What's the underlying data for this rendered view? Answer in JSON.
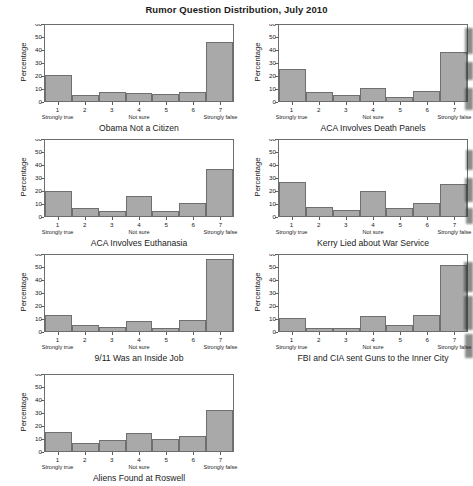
{
  "figure": {
    "title": "Rumor Question Distribution, July 2010",
    "ylabel": "Percentage",
    "yticks": [
      "0",
      "10",
      "20",
      "30",
      "40",
      "50",
      "60"
    ],
    "xticks": [
      "1",
      "2",
      "3",
      "4",
      "5",
      "6",
      "7"
    ],
    "xsub_1": "Strongly true",
    "xsub_4": "Not sure",
    "xsub_7": "Strongly false"
  },
  "chart_data": [
    {
      "type": "bar",
      "title": "Obama Not a Citizen",
      "xlabel": "Obama Not a Citizen",
      "ylabel": "Percentage",
      "categories": [
        "1",
        "2",
        "3",
        "4",
        "5",
        "6",
        "7"
      ],
      "category_labels": [
        "Strongly true",
        "",
        "",
        "Not sure",
        "",
        "",
        "Strongly false"
      ],
      "values": [
        20.5,
        4.5,
        7.0,
        6.0,
        5.5,
        7.5,
        46.5
      ],
      "ylim": [
        0,
        60
      ],
      "yticks": [
        0,
        10,
        20,
        30,
        40,
        50,
        60
      ],
      "grid": false,
      "legend": "none"
    },
    {
      "type": "bar",
      "title": "ACA Involves Death Panels",
      "xlabel": "ACA Involves Death Panels",
      "ylabel": "Percentage",
      "categories": [
        "1",
        "2",
        "3",
        "4",
        "5",
        "6",
        "7"
      ],
      "category_labels": [
        "Strongly true",
        "",
        "",
        "Not sure",
        "",
        "",
        "Strongly false"
      ],
      "values": [
        25.0,
        7.0,
        5.0,
        10.5,
        3.0,
        8.0,
        39.0
      ],
      "ylim": [
        0,
        60
      ],
      "yticks": [
        0,
        10,
        20,
        30,
        40,
        50,
        60
      ],
      "grid": false,
      "legend": "none"
    },
    {
      "type": "bar",
      "title": "ACA Involves Euthanasia",
      "xlabel": "ACA Involves Euthanasia",
      "ylabel": "Percentage",
      "categories": [
        "1",
        "2",
        "3",
        "4",
        "5",
        "6",
        "7"
      ],
      "category_labels": [
        "Strongly true",
        "",
        "",
        "Not sure",
        "",
        "",
        "Strongly false"
      ],
      "values": [
        19.5,
        6.0,
        4.0,
        15.5,
        4.0,
        10.0,
        37.0
      ],
      "ylim": [
        0,
        60
      ],
      "yticks": [
        0,
        10,
        20,
        30,
        40,
        50,
        60
      ],
      "grid": false,
      "legend": "none"
    },
    {
      "type": "bar",
      "title": "Kerry Lied about War Service",
      "xlabel": "Kerry Lied about War Service",
      "ylabel": "Percentage",
      "categories": [
        "1",
        "2",
        "3",
        "4",
        "5",
        "6",
        "7"
      ],
      "category_labels": [
        "Strongly true",
        "",
        "",
        "Not sure",
        "",
        "",
        "Strongly false"
      ],
      "values": [
        27.0,
        7.0,
        5.0,
        19.5,
        6.0,
        10.0,
        25.0
      ],
      "ylim": [
        0,
        60
      ],
      "yticks": [
        0,
        10,
        20,
        30,
        40,
        50,
        60
      ],
      "grid": false,
      "legend": "none"
    },
    {
      "type": "bar",
      "title": "9/11 Was an Inside Job",
      "xlabel": "9/11 Was an Inside Job",
      "ylabel": "Percentage",
      "categories": [
        "1",
        "2",
        "3",
        "4",
        "5",
        "6",
        "7"
      ],
      "category_labels": [
        "Strongly true",
        "",
        "",
        "Not sure",
        "",
        "",
        "Strongly false"
      ],
      "values": [
        13.0,
        4.5,
        3.0,
        8.0,
        2.0,
        8.5,
        56.5
      ],
      "ylim": [
        0,
        60
      ],
      "yticks": [
        0,
        10,
        20,
        30,
        40,
        50,
        60
      ],
      "grid": false,
      "legend": "none"
    },
    {
      "type": "bar",
      "title": "FBI and CIA sent Guns to the Inner City",
      "xlabel": "FBI and CIA sent Guns to the Inner City",
      "ylabel": "Percentage",
      "categories": [
        "1",
        "2",
        "3",
        "4",
        "5",
        "6",
        "7"
      ],
      "category_labels": [
        "Strongly true",
        "",
        "",
        "Not sure",
        "",
        "",
        "Strongly false"
      ],
      "values": [
        10.0,
        2.5,
        2.5,
        11.5,
        4.5,
        12.5,
        52.0
      ],
      "ylim": [
        0,
        60
      ],
      "yticks": [
        0,
        10,
        20,
        30,
        40,
        50,
        60
      ],
      "grid": false,
      "legend": "none"
    },
    {
      "type": "bar",
      "title": "Aliens Found at Roswell",
      "xlabel": "Aliens Found at Roswell",
      "ylabel": "Percentage",
      "categories": [
        "1",
        "2",
        "3",
        "4",
        "5",
        "6",
        "7"
      ],
      "category_labels": [
        "Strongly true",
        "",
        "",
        "Not sure",
        "",
        "",
        "Strongly false"
      ],
      "values": [
        15.0,
        6.0,
        9.0,
        14.0,
        9.5,
        11.5,
        32.5
      ],
      "ylim": [
        0,
        60
      ],
      "yticks": [
        0,
        10,
        20,
        30,
        40,
        50,
        60
      ],
      "grid": false,
      "legend": "none"
    }
  ],
  "style": {
    "bar_fill": "#a9a9a9",
    "bar_stroke": "#6f6f6f",
    "axis_color": "#6d6d6d",
    "text_color": "#1b1b1b",
    "background": "#ffffff"
  }
}
